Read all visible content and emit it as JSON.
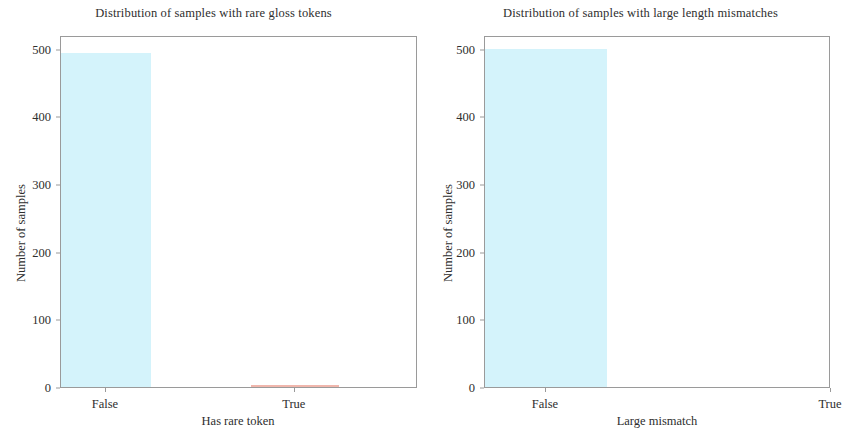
{
  "figure": {
    "width": 854,
    "height": 436,
    "background": "#ffffff"
  },
  "chart_data": [
    {
      "type": "bar",
      "title": "Distribution of samples with rare gloss tokens",
      "xlabel": "Has rare token",
      "ylabel": "Number of samples",
      "categories": [
        "False",
        "True"
      ],
      "values": [
        493,
        3
      ],
      "bar_colors": [
        "#d4f3fb",
        "#f0b6ac"
      ],
      "ylim": [
        0,
        520
      ],
      "yticks": [
        0,
        100,
        200,
        300,
        400,
        500
      ],
      "ytick_labels": [
        "0",
        "100",
        "200",
        "300",
        "400",
        "500"
      ],
      "grid": false,
      "legend": "none"
    },
    {
      "type": "bar",
      "title": "Distribution of samples with large length mismatches",
      "xlabel": "Large mismatch",
      "ylabel": "Number of samples",
      "categories": [
        "False",
        "True"
      ],
      "values": [
        500,
        0
      ],
      "bar_colors": [
        "#d4f3fb",
        "#f0b6ac"
      ],
      "ylim": [
        0,
        520
      ],
      "yticks": [
        0,
        100,
        200,
        300,
        400,
        500
      ],
      "ytick_labels": [
        "0",
        "100",
        "200",
        "300",
        "400",
        "500"
      ],
      "grid": false,
      "legend": "none"
    }
  ]
}
